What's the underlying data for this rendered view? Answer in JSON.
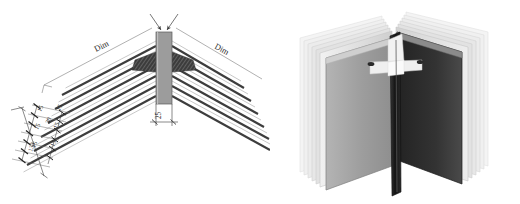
{
  "figure": {
    "background_color": "#ffffff",
    "views": [
      {
        "name": "dimensioned-line-drawing",
        "position": "left"
      },
      {
        "name": "shaded-3d-render",
        "position": "right"
      }
    ]
  },
  "drawing": {
    "labels": {
      "dim_left": "Dim",
      "dim_right": "Dim",
      "center_width": "25",
      "overall_stack": "133",
      "middle_gap": "30"
    },
    "spacing_labels": [
      "15",
      "15",
      "15",
      "15",
      "15",
      "15"
    ],
    "colors": {
      "line": "#3a3a3a",
      "thin_line": "#8d8d8d",
      "center_bar_fill": "#9a9a9a",
      "center_bar_stroke": "#5a5a5a",
      "wedge_fill": "#3c3c3c",
      "text": "#2b2b2b"
    },
    "counts": {
      "panels_per_side": 6,
      "dimension_ticks": 7
    },
    "notes": {
      "top_arrows": "two inward arrows marking the center bar width",
      "bottom_dim": "25 between extension lines below center bar"
    }
  },
  "render": {
    "description": "Grayscale shaded 3D view of a V-shaped book-like corner with stacked translucent layered panels and a light cross-shaped connector at the top of the dark center post",
    "colors": {
      "left_face_light": "#c9c9c9",
      "left_face_mid": "#a8a8a8",
      "left_face_dark": "#8a8a8a",
      "right_face_dark": "#2e2e2e",
      "right_face_mid": "#4a4a4a",
      "layer_ghost": "#e3e3e3",
      "post_dark": "#1d1d1d",
      "connector_light": "#efefef",
      "top_edge": "#d6d6d6"
    },
    "layers": 6
  }
}
